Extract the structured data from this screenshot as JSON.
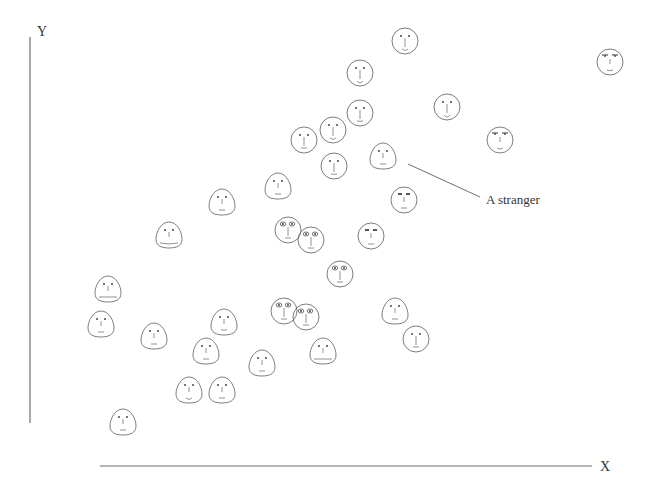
{
  "chart_data": {
    "type": "scatter",
    "title": "",
    "xlabel": "X",
    "ylabel": "Y",
    "marker": "chernoff-face",
    "grid": false,
    "legend": null,
    "annotations": [
      {
        "text": "A stranger",
        "target_index": 9,
        "x": 486,
        "y": 199
      }
    ],
    "points": [
      {
        "x": 405,
        "y": 41,
        "shape": "round",
        "mouth": 0.6,
        "eyes": "dot"
      },
      {
        "x": 360,
        "y": 73,
        "shape": "round",
        "mouth": 0.8,
        "eyes": "dot"
      },
      {
        "x": 360,
        "y": 113,
        "shape": "round",
        "mouth": 0.1,
        "eyes": "dot"
      },
      {
        "x": 333,
        "y": 130,
        "shape": "round",
        "mouth": 0.6,
        "eyes": "dot"
      },
      {
        "x": 304,
        "y": 140,
        "shape": "round",
        "mouth": 0.0,
        "eyes": "dot"
      },
      {
        "x": 334,
        "y": 166,
        "shape": "round",
        "mouth": 0.1,
        "eyes": "dot"
      },
      {
        "x": 447,
        "y": 107,
        "shape": "round",
        "mouth": 0.8,
        "eyes": "dot"
      },
      {
        "x": 500,
        "y": 140,
        "shape": "round",
        "mouth": 0.5,
        "eyes": "brow"
      },
      {
        "x": 610,
        "y": 62,
        "shape": "round",
        "mouth": 0.3,
        "eyes": "brow"
      },
      {
        "x": 383,
        "y": 156,
        "shape": "egg",
        "mouth": 0.0,
        "eyes": "dot"
      },
      {
        "x": 278,
        "y": 186,
        "shape": "egg",
        "mouth": 0.0,
        "eyes": "dot"
      },
      {
        "x": 404,
        "y": 200,
        "shape": "round",
        "mouth": 0.0,
        "eyes": "box"
      },
      {
        "x": 222,
        "y": 202,
        "shape": "egg",
        "mouth": 0.0,
        "eyes": "dot"
      },
      {
        "x": 169,
        "y": 235,
        "shape": "egg",
        "mouth": 0.4,
        "eyes": "dot",
        "wide_mouth": true
      },
      {
        "x": 288,
        "y": 230,
        "shape": "round",
        "mouth": 0.0,
        "eyes": "big"
      },
      {
        "x": 311,
        "y": 240,
        "shape": "round",
        "mouth": 0.0,
        "eyes": "big"
      },
      {
        "x": 371,
        "y": 236,
        "shape": "round",
        "mouth": 0.0,
        "eyes": "box"
      },
      {
        "x": 340,
        "y": 274,
        "shape": "round",
        "mouth": 0.0,
        "eyes": "big"
      },
      {
        "x": 108,
        "y": 289,
        "shape": "egg",
        "mouth": 0.0,
        "eyes": "dot",
        "wide_mouth": true
      },
      {
        "x": 101,
        "y": 324,
        "shape": "egg",
        "mouth": 0.0,
        "eyes": "dot"
      },
      {
        "x": 154,
        "y": 336,
        "shape": "egg",
        "mouth": 0.0,
        "eyes": "dot"
      },
      {
        "x": 224,
        "y": 322,
        "shape": "egg",
        "mouth": 0.0,
        "eyes": "dot"
      },
      {
        "x": 284,
        "y": 311,
        "shape": "round",
        "mouth": 0.0,
        "eyes": "big"
      },
      {
        "x": 306,
        "y": 317,
        "shape": "round",
        "mouth": 0.0,
        "eyes": "big"
      },
      {
        "x": 395,
        "y": 311,
        "shape": "egg",
        "mouth": 0.0,
        "eyes": "dot"
      },
      {
        "x": 416,
        "y": 339,
        "shape": "round",
        "mouth": 0.0,
        "eyes": "dot"
      },
      {
        "x": 206,
        "y": 351,
        "shape": "egg",
        "mouth": 0.0,
        "eyes": "dot"
      },
      {
        "x": 262,
        "y": 363,
        "shape": "egg",
        "mouth": 0.0,
        "eyes": "dot"
      },
      {
        "x": 323,
        "y": 351,
        "shape": "egg",
        "mouth": 0.0,
        "eyes": "dot",
        "wide_mouth": true
      },
      {
        "x": 189,
        "y": 390,
        "shape": "egg",
        "mouth": 0.6,
        "eyes": "dot"
      },
      {
        "x": 222,
        "y": 390,
        "shape": "egg",
        "mouth": 0.0,
        "eyes": "dot"
      },
      {
        "x": 123,
        "y": 422,
        "shape": "egg",
        "mouth": 0.0,
        "eyes": "dot"
      }
    ],
    "axes": {
      "y": {
        "x": 30,
        "y1": 37,
        "y2": 423
      },
      "x": {
        "y": 466,
        "x1": 100,
        "x2": 592
      }
    },
    "colors": {
      "stroke": "#6e6e6e",
      "text": "#333333"
    }
  },
  "labels": {
    "x_axis": "X",
    "y_axis": "Y",
    "annotation": "A stranger"
  }
}
